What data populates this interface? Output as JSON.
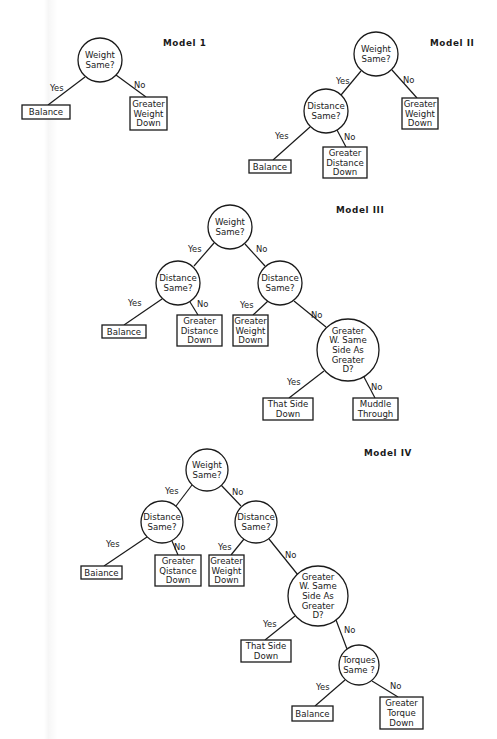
{
  "models": [
    {
      "id": "model-1",
      "title": "Model 1",
      "title_pos": [
        163,
        46
      ],
      "nodes": [
        {
          "id": "n1",
          "type": "decision",
          "x": 100,
          "y": 60,
          "r": 22,
          "lines": [
            "Weight",
            "Same?"
          ]
        },
        {
          "id": "n2",
          "type": "outcome",
          "x": 22,
          "y": 105,
          "w": 48,
          "h": 14,
          "lines": [
            "Balance"
          ]
        },
        {
          "id": "n3",
          "type": "outcome",
          "x": 130,
          "y": 97,
          "w": 37,
          "h": 33,
          "lines": [
            "Greater",
            "Weight",
            "Down"
          ]
        }
      ],
      "edges": [
        {
          "from": [
            85,
            77
          ],
          "to": [
            48,
            105
          ],
          "label": "Yes",
          "label_pos": [
            50,
            91
          ]
        },
        {
          "from": [
            116,
            75
          ],
          "to": [
            146,
            97
          ],
          "label": "No",
          "label_pos": [
            134,
            88
          ]
        }
      ]
    },
    {
      "id": "model-2",
      "title": "Model II",
      "title_pos": [
        430,
        46
      ],
      "nodes": [
        {
          "id": "n1",
          "type": "decision",
          "x": 376,
          "y": 54,
          "r": 22,
          "lines": [
            "Weight",
            "Same?"
          ]
        },
        {
          "id": "n2",
          "type": "decision",
          "x": 326,
          "y": 111,
          "r": 22,
          "lines": [
            "Distance",
            "Same?"
          ]
        },
        {
          "id": "n3",
          "type": "outcome",
          "x": 402,
          "y": 98,
          "w": 36,
          "h": 31,
          "lines": [
            "Greater",
            "Weight",
            "Down"
          ]
        },
        {
          "id": "n4",
          "type": "outcome",
          "x": 249,
          "y": 160,
          "w": 42,
          "h": 13,
          "lines": [
            "Balance"
          ]
        },
        {
          "id": "n5",
          "type": "outcome",
          "x": 323,
          "y": 147,
          "w": 44,
          "h": 31,
          "lines": [
            "Greater",
            "Distance",
            "Down"
          ]
        }
      ],
      "edges": [
        {
          "from": [
            361,
            71
          ],
          "to": [
            341,
            95
          ],
          "label": "Yes",
          "label_pos": [
            336,
            84
          ]
        },
        {
          "from": [
            392,
            70
          ],
          "to": [
            417,
            98
          ],
          "label": "No",
          "label_pos": [
            403,
            83
          ]
        },
        {
          "from": [
            310,
            127
          ],
          "to": [
            273,
            160
          ],
          "label": "Yes",
          "label_pos": [
            275,
            139
          ]
        },
        {
          "from": [
            337,
            130
          ],
          "to": [
            346,
            147
          ],
          "label": "No",
          "label_pos": [
            344,
            140
          ]
        }
      ]
    },
    {
      "id": "model-3",
      "title": "Model III",
      "title_pos": [
        336,
        213
      ],
      "nodes": [
        {
          "id": "n1",
          "type": "decision",
          "x": 230,
          "y": 227,
          "r": 22,
          "lines": [
            "Weight",
            "Same?"
          ]
        },
        {
          "id": "n2",
          "type": "decision",
          "x": 178,
          "y": 283,
          "r": 22,
          "lines": [
            "Distance",
            "Same?"
          ]
        },
        {
          "id": "n3",
          "type": "decision",
          "x": 280,
          "y": 283,
          "r": 22,
          "lines": [
            "Distance",
            "Same?"
          ]
        },
        {
          "id": "n4",
          "type": "outcome",
          "x": 102,
          "y": 325,
          "w": 44,
          "h": 13,
          "lines": [
            "Balance"
          ]
        },
        {
          "id": "n5",
          "type": "outcome",
          "x": 177,
          "y": 315,
          "w": 45,
          "h": 31,
          "lines": [
            "Greater",
            "Distance",
            "Down"
          ]
        },
        {
          "id": "n6",
          "type": "outcome",
          "x": 233,
          "y": 315,
          "w": 35,
          "h": 31,
          "lines": [
            "Greater",
            "Weight",
            "Down"
          ]
        },
        {
          "id": "n7",
          "type": "decision",
          "x": 348,
          "y": 350,
          "r": 31,
          "lines": [
            "Greater",
            "W. Same",
            "Side As",
            "Greater",
            "D?"
          ]
        },
        {
          "id": "n8",
          "type": "outcome",
          "x": 263,
          "y": 398,
          "w": 50,
          "h": 22,
          "lines": [
            "That Side",
            "Down"
          ]
        },
        {
          "id": "n9",
          "type": "outcome",
          "x": 353,
          "y": 398,
          "w": 45,
          "h": 22,
          "lines": [
            "Muddle",
            "Through"
          ]
        }
      ],
      "edges": [
        {
          "from": [
            214,
            243
          ],
          "to": [
            194,
            266
          ],
          "label": "Yes",
          "label_pos": [
            188,
            252
          ]
        },
        {
          "from": [
            245,
            244
          ],
          "to": [
            265,
            266
          ],
          "label": "No",
          "label_pos": [
            256,
            252
          ]
        },
        {
          "from": [
            162,
            299
          ],
          "to": [
            124,
            325
          ],
          "label": "Yes",
          "label_pos": [
            128,
            306
          ]
        },
        {
          "from": [
            190,
            302
          ],
          "to": [
            198,
            315
          ],
          "label": "No",
          "label_pos": [
            197,
            307
          ]
        },
        {
          "from": [
            268,
            301
          ],
          "to": [
            253,
            315
          ],
          "label": "Yes",
          "label_pos": [
            240,
            308
          ]
        },
        {
          "from": [
            294,
            301
          ],
          "to": [
            326,
            327
          ],
          "label": "No",
          "label_pos": [
            311,
            318
          ]
        },
        {
          "from": [
            324,
            371
          ],
          "to": [
            289,
            398
          ],
          "label": "Yes",
          "label_pos": [
            287,
            385
          ]
        },
        {
          "from": [
            364,
            377
          ],
          "to": [
            375,
            398
          ],
          "label": "No",
          "label_pos": [
            371,
            390
          ]
        }
      ]
    },
    {
      "id": "model-4",
      "title": "Model IV",
      "title_pos": [
        364,
        456
      ],
      "nodes": [
        {
          "id": "n1",
          "type": "decision",
          "x": 207,
          "y": 470,
          "r": 21,
          "lines": [
            "Weight",
            "Same?"
          ]
        },
        {
          "id": "n2",
          "type": "decision",
          "x": 162,
          "y": 522,
          "r": 21,
          "lines": [
            "Distance",
            "Same?"
          ]
        },
        {
          "id": "n3",
          "type": "decision",
          "x": 256,
          "y": 522,
          "r": 21,
          "lines": [
            "Distance",
            "Same?"
          ]
        },
        {
          "id": "n4",
          "type": "outcome",
          "x": 81,
          "y": 566,
          "w": 41,
          "h": 13,
          "lines": [
            "Baiance"
          ]
        },
        {
          "id": "n5",
          "type": "outcome",
          "x": 155,
          "y": 555,
          "w": 46,
          "h": 31,
          "lines": [
            "Greater",
            "Qistance",
            "Down"
          ]
        },
        {
          "id": "n6",
          "type": "outcome",
          "x": 209,
          "y": 555,
          "w": 35,
          "h": 31,
          "lines": [
            "Greater",
            "Weight",
            "Down"
          ]
        },
        {
          "id": "n7",
          "type": "decision",
          "x": 318,
          "y": 596,
          "r": 30,
          "lines": [
            "Greater",
            "W. Same",
            "Side As",
            "Greater",
            "D?"
          ]
        },
        {
          "id": "n8",
          "type": "outcome",
          "x": 241,
          "y": 640,
          "w": 50,
          "h": 22,
          "lines": [
            "That Side",
            "Down"
          ]
        },
        {
          "id": "n9",
          "type": "decision",
          "x": 359,
          "y": 665,
          "r": 20,
          "lines": [
            "Torques",
            "Same ?"
          ]
        },
        {
          "id": "n10",
          "type": "outcome",
          "x": 292,
          "y": 706,
          "w": 41,
          "h": 15,
          "lines": [
            "Balance"
          ]
        },
        {
          "id": "n11",
          "type": "outcome",
          "x": 380,
          "y": 697,
          "w": 43,
          "h": 32,
          "lines": [
            "Greater",
            "Torque",
            "Down"
          ]
        }
      ],
      "edges": [
        {
          "from": [
            192,
            485
          ],
          "to": [
            176,
            506
          ],
          "label": "Yes",
          "label_pos": [
            165,
            494
          ]
        },
        {
          "from": [
            221,
            485
          ],
          "to": [
            241,
            506
          ],
          "label": "No",
          "label_pos": [
            232,
            495
          ]
        },
        {
          "from": [
            147,
            537
          ],
          "to": [
            104,
            566
          ],
          "label": "Yes",
          "label_pos": [
            106,
            547
          ]
        },
        {
          "from": [
            172,
            541
          ],
          "to": [
            178,
            555
          ],
          "label": "No",
          "label_pos": [
            174,
            550
          ]
        },
        {
          "from": [
            244,
            539
          ],
          "to": [
            231,
            555
          ],
          "label": "Yes",
          "label_pos": [
            218,
            550
          ]
        },
        {
          "from": [
            269,
            539
          ],
          "to": [
            298,
            575
          ],
          "label": "No",
          "label_pos": [
            285,
            558
          ]
        },
        {
          "from": [
            295,
            616
          ],
          "to": [
            265,
            640
          ],
          "label": "Yes",
          "label_pos": [
            263,
            627
          ]
        },
        {
          "from": [
            336,
            620
          ],
          "to": [
            347,
            649
          ],
          "label": "No",
          "label_pos": [
            344,
            633
          ]
        },
        {
          "from": [
            345,
            680
          ],
          "to": [
            315,
            706
          ],
          "label": "Yes",
          "label_pos": [
            316,
            690
          ]
        },
        {
          "from": [
            372,
            681
          ],
          "to": [
            398,
            697
          ],
          "label": "No",
          "label_pos": [
            390,
            689
          ]
        }
      ]
    }
  ]
}
